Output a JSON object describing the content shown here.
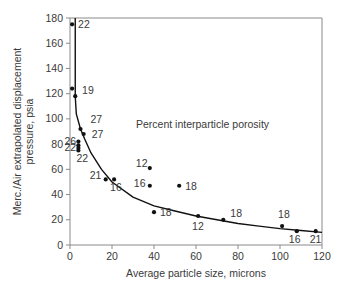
{
  "chart_data": {
    "type": "scatter",
    "title": "",
    "xlabel": "Average particle size, microns",
    "ylabel": "Merc./Air extrapolated displacement pressure, psia",
    "ylabel_lines": [
      "Merc./Air extrapolated displacement",
      "pressure, psia"
    ],
    "xlim": [
      0,
      120
    ],
    "ylim": [
      0,
      180
    ],
    "xticks": [
      0,
      20,
      40,
      60,
      80,
      100,
      120
    ],
    "yticks": [
      0,
      20,
      40,
      60,
      80,
      100,
      120,
      140,
      160,
      180
    ],
    "grid": false,
    "legend": null,
    "annotation": "Percent interparticle porosity",
    "series": [
      {
        "name": "Samples",
        "points": [
          {
            "x": 1,
            "y": 175,
            "label": "22"
          },
          {
            "x": 1,
            "y": 124,
            "label": "19"
          },
          {
            "x": 2.5,
            "y": 118,
            "label": ""
          },
          {
            "x": 5,
            "y": 92,
            "label": "27"
          },
          {
            "x": 6.5,
            "y": 88,
            "label": "27"
          },
          {
            "x": 4,
            "y": 82,
            "label": "26"
          },
          {
            "x": 4,
            "y": 79,
            "label": "22"
          },
          {
            "x": 4,
            "y": 77,
            "label": ""
          },
          {
            "x": 4,
            "y": 75,
            "label": "22"
          },
          {
            "x": 17,
            "y": 52,
            "label": "21"
          },
          {
            "x": 21,
            "y": 52,
            "label": "16"
          },
          {
            "x": 38,
            "y": 61,
            "label": "12"
          },
          {
            "x": 38,
            "y": 47,
            "label": "16"
          },
          {
            "x": 52,
            "y": 47,
            "label": "18"
          },
          {
            "x": 40,
            "y": 26,
            "label": "18"
          },
          {
            "x": 61,
            "y": 23,
            "label": "12"
          },
          {
            "x": 73,
            "y": 20,
            "label": "18"
          },
          {
            "x": 101,
            "y": 15,
            "label": "18"
          },
          {
            "x": 108,
            "y": 11,
            "label": "16"
          },
          {
            "x": 117,
            "y": 11,
            "label": "21"
          }
        ]
      },
      {
        "name": "Fitted curve",
        "type": "line",
        "x": [
          2.5,
          2.5,
          3,
          5,
          7,
          10,
          15,
          20,
          30,
          40,
          50,
          60,
          70,
          80,
          90,
          100,
          110,
          120
        ],
        "y": [
          180,
          118,
          104,
          92,
          84,
          73,
          60,
          50,
          38,
          31,
          27,
          23,
          20,
          17,
          15,
          13,
          11.5,
          10
        ]
      }
    ]
  }
}
